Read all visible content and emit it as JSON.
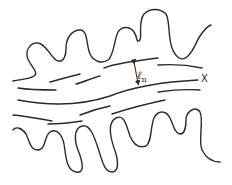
{
  "diagram": {
    "type": "schematic",
    "labels": {
      "thickness_symbol": "ℓ",
      "thickness_subscript": "n",
      "axis_label": "X"
    },
    "colors": {
      "stroke": "#2a2a2a",
      "background": "#ffffff"
    },
    "elements": [
      {
        "name": "upper-wavy-boundary"
      },
      {
        "name": "lower-wavy-boundary"
      },
      {
        "name": "streamline-dashes"
      },
      {
        "name": "thickness-arrow"
      }
    ]
  }
}
